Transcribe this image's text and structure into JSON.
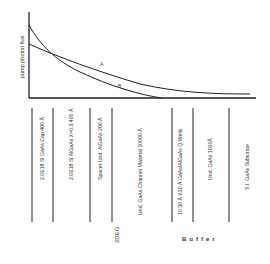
{
  "diagram": {
    "y_axis_label": "pump photon flux",
    "curves": [
      {
        "id": "A",
        "label": "A",
        "description": "shallow decay curve"
      },
      {
        "id": "B",
        "label": "B",
        "description": "steep decay curve"
      }
    ],
    "layers": [
      {
        "label": "2.0E18 Si GaAs Cap 400 Å"
      },
      {
        "label": "2.0E18 Si AlGaAs X=0.3 400 Å"
      },
      {
        "label": "Spacer Und. AlGaAs 200 Å"
      },
      {
        "label": "Und. GaAs Channel Material 10000 Å"
      },
      {
        "label": "10 30 Å X30 Å GaAs/AlGaAs Q.Wells"
      },
      {
        "label": "Und. GaAs 1000Å"
      },
      {
        "label": "S.I. GaAs Substrate"
      }
    ],
    "regions": {
      "left": "2DEG",
      "right": "Buffer"
    },
    "colors": {
      "line": "#222222",
      "text": "#333333",
      "background": "#ffffff"
    }
  }
}
